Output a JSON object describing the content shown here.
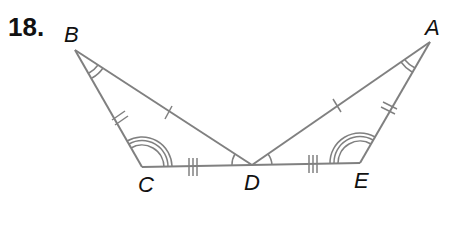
{
  "problem": {
    "number": "18."
  },
  "colors": {
    "line": "#808080",
    "text": "#111111"
  },
  "points": {
    "A": {
      "label": "A",
      "x": 430,
      "y": 42
    },
    "B": {
      "label": "B",
      "x": 75,
      "y": 50
    },
    "C": {
      "label": "C",
      "x": 142,
      "y": 167
    },
    "D": {
      "label": "D",
      "x": 252,
      "y": 165
    },
    "E": {
      "label": "E",
      "x": 360,
      "y": 163
    }
  },
  "segments": [
    {
      "from": "B",
      "to": "C",
      "ticks": 2
    },
    {
      "from": "B",
      "to": "D",
      "ticks": 1
    },
    {
      "from": "C",
      "to": "D",
      "ticks": 3
    },
    {
      "from": "D",
      "to": "E",
      "ticks": 3
    },
    {
      "from": "A",
      "to": "D",
      "ticks": 1
    },
    {
      "from": "A",
      "to": "E",
      "ticks": 2
    }
  ],
  "angle_marks": [
    {
      "vertex": "B",
      "arcs": 2
    },
    {
      "vertex": "A",
      "arcs": 2
    },
    {
      "vertex": "C",
      "arcs": 3
    },
    {
      "vertex": "E",
      "arcs": 3
    },
    {
      "vertex": "D",
      "side": "left",
      "arcs": 1
    },
    {
      "vertex": "D",
      "side": "right",
      "arcs": 1
    }
  ]
}
